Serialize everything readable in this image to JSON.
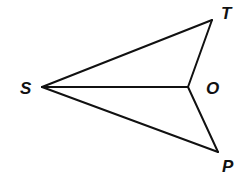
{
  "diagram": {
    "type": "geometry-figure",
    "points": {
      "S": {
        "label": "S",
        "x": 42,
        "y": 87
      },
      "T": {
        "label": "T",
        "x": 212,
        "y": 20
      },
      "O": {
        "label": "O",
        "x": 188,
        "y": 87
      },
      "P": {
        "label": "P",
        "x": 218,
        "y": 152
      }
    },
    "segments": [
      {
        "from": "S",
        "to": "T"
      },
      {
        "from": "S",
        "to": "O"
      },
      {
        "from": "S",
        "to": "P"
      },
      {
        "from": "T",
        "to": "O"
      },
      {
        "from": "O",
        "to": "P"
      }
    ],
    "labels": {
      "S": "S",
      "T": "T",
      "O": "O",
      "P": "P"
    },
    "colors": {
      "stroke": "#111111",
      "label": "#111111",
      "background": "#ffffff"
    }
  }
}
